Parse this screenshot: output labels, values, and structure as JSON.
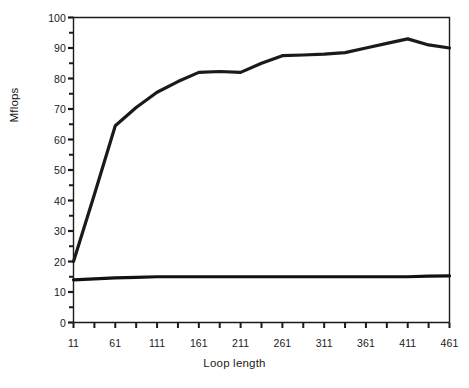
{
  "chart_data": {
    "type": "line",
    "title": "",
    "xlabel": "Loop length",
    "ylabel": "Mflops",
    "xlim": [
      11,
      461
    ],
    "ylim": [
      0,
      100
    ],
    "grid": false,
    "legend": "none",
    "y_ticks_major": [
      0,
      10,
      20,
      30,
      40,
      50,
      60,
      70,
      80,
      90,
      100
    ],
    "y_tick_step_minor": 5,
    "x_ticks_major": [
      11,
      61,
      111,
      161,
      211,
      261,
      311,
      361,
      411,
      461
    ],
    "x_tick_step_minor": 25,
    "x": [
      11,
      36,
      61,
      86,
      111,
      136,
      161,
      186,
      211,
      236,
      261,
      286,
      311,
      336,
      361,
      386,
      411,
      436,
      461
    ],
    "series": [
      {
        "name": "upper-curve",
        "color": "#1a1a1a",
        "values": [
          20,
          42,
          64.5,
          70.5,
          75.5,
          79,
          82,
          82.3,
          82,
          85,
          87.5,
          87.7,
          88,
          88.5,
          90,
          91.5,
          93,
          91,
          90
        ]
      },
      {
        "name": "lower-curve",
        "color": "#111111",
        "values": [
          14,
          14.3,
          14.6,
          14.8,
          15,
          15,
          15,
          15,
          15,
          15,
          15,
          15,
          15,
          15,
          15,
          15,
          15,
          15.2,
          15.3
        ]
      }
    ]
  },
  "axes": {
    "ytick_labels": [
      "100",
      "90",
      "80",
      "70",
      "60",
      "50",
      "40",
      "30",
      "20",
      "10",
      "0"
    ],
    "xtick_labels": [
      "11",
      "61",
      "111",
      "161",
      "211",
      "261",
      "311",
      "361",
      "411",
      "461"
    ]
  },
  "colors": {
    "axis": "#1a1a1a",
    "line": "#1a1a1a",
    "background": "#ffffff",
    "text": "#1a1a1a"
  }
}
